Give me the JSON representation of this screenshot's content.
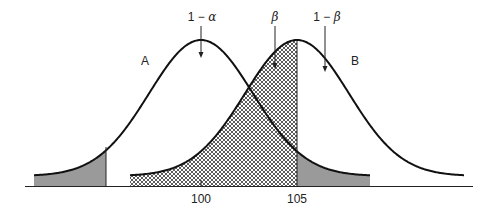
{
  "diagram": {
    "title": "",
    "curves": [
      {
        "id": "A",
        "label": "A",
        "mean": 100,
        "peak_x_px": 201
      },
      {
        "id": "B",
        "label": "B",
        "mean": 105,
        "peak_x_px": 297
      }
    ],
    "annotations": {
      "one_minus_alpha": {
        "prefix": "1 − ",
        "symbol": "α"
      },
      "beta": {
        "symbol": "β"
      },
      "one_minus_beta": {
        "prefix": "1 − ",
        "symbol": "β"
      }
    },
    "axis": {
      "ticks": [
        {
          "label": "100",
          "x_px": 201
        },
        {
          "label": "105",
          "x_px": 297
        }
      ]
    },
    "regions": [
      {
        "name": "alpha-lower-tail-A",
        "fill": "gray",
        "color": "#9a9a9a"
      },
      {
        "name": "beta-region",
        "fill": "crosshatch",
        "color": "#333333"
      },
      {
        "name": "alpha-upper-tail-A",
        "fill": "gray",
        "color": "#9a9a9a"
      }
    ]
  }
}
